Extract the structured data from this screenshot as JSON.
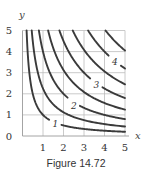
{
  "caption": "Figure 14.72",
  "colors": {
    "contour": "#3a3a3a",
    "grid": "#bdbdbd",
    "axis": "#9a9a9a",
    "text": "#333333"
  },
  "chart_data": {
    "type": "contour",
    "title": "",
    "caption": "Figure 14.72",
    "xlabel": "x",
    "ylabel": "y",
    "xlim": [
      0,
      5
    ],
    "ylim": [
      0,
      5
    ],
    "xticks": [
      1,
      2,
      3,
      4,
      5
    ],
    "yticks": [
      0,
      1,
      2,
      3,
      4,
      5
    ],
    "grid": true,
    "function_estimate": "f(x,y) = sqrt(x*y)",
    "contour_levels": [
      1,
      1.5,
      2,
      2.5,
      3,
      3.5,
      4,
      4.5
    ],
    "labeled_levels": [
      {
        "label": "1",
        "value": 1,
        "x": 1.6,
        "y": 0.55
      },
      {
        "label": "2",
        "value": 2,
        "x": 2.5,
        "y": 1.4
      },
      {
        "label": "3",
        "value": 3,
        "x": 3.6,
        "y": 2.4
      },
      {
        "label": "4",
        "value": 4,
        "x": 4.5,
        "y": 3.5
      }
    ]
  }
}
